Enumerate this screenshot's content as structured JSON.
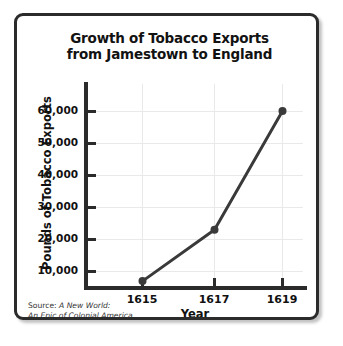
{
  "chart_data": {
    "type": "line",
    "title": "Growth of Tobacco Exports from Jamestown to England",
    "title_lines": [
      "Growth of Tobacco Exports",
      "from Jamestown to England"
    ],
    "xlabel": "Year",
    "ylabel": "Pounds of Tobacco Exports",
    "x": [
      1615,
      1617,
      1619
    ],
    "categories": [
      "1615",
      "1617",
      "1619"
    ],
    "values": [
      2000,
      19500,
      60000
    ],
    "series": [
      {
        "name": "Pounds of Tobacco Exports",
        "values": [
          2000,
          19500,
          60000
        ]
      }
    ],
    "xlim": [
      1614,
      1620
    ],
    "ylim": [
      0,
      65000
    ],
    "y_ticks": [
      10000,
      20000,
      30000,
      40000,
      50000,
      60000
    ],
    "y_tick_labels": [
      "10,000",
      "20,000",
      "30,000",
      "40,000",
      "50,000",
      "60,000"
    ],
    "x_ticks": [
      1615,
      1617,
      1619
    ],
    "x_tick_labels": [
      "1615",
      "1617",
      "1619"
    ],
    "grid": true,
    "legend": "none",
    "line_color": "#3a3a3a",
    "marker": "circle",
    "source_prefix": "Source:",
    "source_title_line1": "A New World:",
    "source_title_line2": "An Epic of Colonial America"
  },
  "axis": {
    "y_labels": {
      "t10": "10,000",
      "t20": "20,000",
      "t30": "30,000",
      "t40": "40,000",
      "t50": "50,000",
      "t60": "60,000"
    },
    "x_labels": {
      "p0": "1615",
      "p1": "1617",
      "p2": "1619"
    },
    "y_title": "Pounds of Tobacco Exports",
    "x_title": "Year"
  },
  "title": {
    "line1": "Growth of Tobacco Exports",
    "line2": "from Jamestown to England"
  },
  "source": {
    "prefix": "Source: ",
    "line1": "A New World:",
    "line2": "An Epic of Colonial America"
  }
}
